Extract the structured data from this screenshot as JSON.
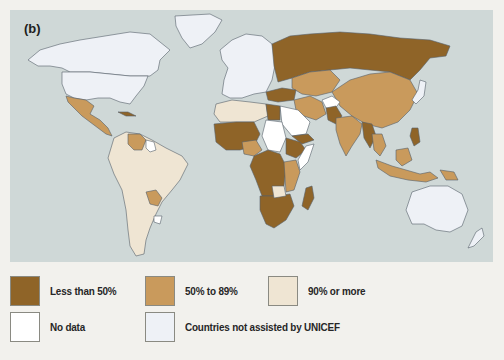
{
  "figure": {
    "panel_label": "(b)",
    "ocean_color": "#cfd8d7"
  },
  "legend": {
    "items": [
      {
        "label": "Less than 50%",
        "color": "#8f6428"
      },
      {
        "label": "50% to 89%",
        "color": "#c99a5c"
      },
      {
        "label": "90% or more",
        "color": "#efe5d3"
      },
      {
        "label": "No data",
        "color": "#ffffff"
      },
      {
        "label": "Countries not assisted by UNICEF",
        "color": "#eef1f6"
      }
    ]
  },
  "map_categories": {
    "less_than_50": [
      "Russia",
      "Kazakhstan",
      "Mongolia (north)",
      "Afghanistan region",
      "Pakistan",
      "Myanmar",
      "Philippines",
      "West Africa",
      "Central Africa",
      "Ethiopia",
      "Yemen",
      "Madagascar",
      "Southern Africa",
      "Cuba",
      "Turkey"
    ],
    "50_to_89": [
      "China",
      "India",
      "Iran",
      "Mexico",
      "Central America",
      "Venezuela",
      "Paraguay",
      "Indonesia",
      "Nigeria region",
      "Thailand",
      "East Africa",
      "Papua New Guinea"
    ],
    "90_or_more": [
      "Brazil",
      "Argentina",
      "Peru",
      "Colombia",
      "Chile",
      "Bolivia",
      "North Africa (Algeria, Libya)"
    ],
    "no_data": [
      "Saudi Arabia",
      "Sudan",
      "Somalia coast",
      "Guyana",
      "Uruguay"
    ],
    "not_assisted": [
      "United States",
      "Canada",
      "Greenland",
      "Europe",
      "Japan",
      "Australia",
      "New Zealand"
    ]
  }
}
